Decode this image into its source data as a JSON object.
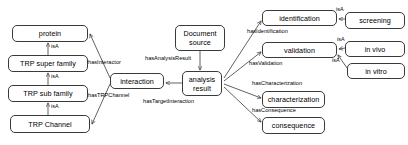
{
  "diagram": {
    "type": "ontology-graph",
    "stroke_color": "#3a3a3a",
    "background_color": "#ffffff",
    "nodes": [
      {
        "id": "protein",
        "label": "protein",
        "x": 12,
        "y": 25,
        "w": 76,
        "h": 17
      },
      {
        "id": "trp_super_family",
        "label": "TRP super family",
        "x": 8,
        "y": 55,
        "w": 80,
        "h": 17
      },
      {
        "id": "trp_sub_family",
        "label": "TRP sub family",
        "x": 8,
        "y": 85,
        "w": 80,
        "h": 17
      },
      {
        "id": "trp_channel",
        "label": "TRP Channel",
        "x": 10,
        "y": 115,
        "w": 80,
        "h": 18
      },
      {
        "id": "interaction",
        "label": "interaction",
        "x": 110,
        "y": 73,
        "w": 54,
        "h": 16
      },
      {
        "id": "document_source",
        "label": "Document\nsource",
        "x": 175,
        "y": 25,
        "w": 50,
        "h": 26
      },
      {
        "id": "analysis_result",
        "label": "analysis\nresult",
        "x": 182,
        "y": 71,
        "w": 40,
        "h": 25
      },
      {
        "id": "identification",
        "label": "identification",
        "x": 262,
        "y": 10,
        "w": 75,
        "h": 16
      },
      {
        "id": "screening",
        "label": "screening",
        "x": 345,
        "y": 12,
        "w": 60,
        "h": 17
      },
      {
        "id": "validation",
        "label": "validation",
        "x": 262,
        "y": 42,
        "w": 75,
        "h": 16
      },
      {
        "id": "in_vivo",
        "label": "in vivo",
        "x": 345,
        "y": 41,
        "w": 60,
        "h": 16
      },
      {
        "id": "in_vitro",
        "label": "in vitro",
        "x": 347,
        "y": 63,
        "w": 58,
        "h": 16
      },
      {
        "id": "characterization",
        "label": "characterization",
        "x": 262,
        "y": 91,
        "w": 63,
        "h": 17
      },
      {
        "id": "consequence",
        "label": "consequence",
        "x": 262,
        "y": 117,
        "w": 63,
        "h": 17
      }
    ],
    "edge_labels": [
      {
        "id": "isa-protein",
        "text": "isA",
        "x": 46,
        "y": 44
      },
      {
        "id": "isa-super",
        "text": "isA",
        "x": 46,
        "y": 74
      },
      {
        "id": "isa-sub",
        "text": "isA",
        "x": 46,
        "y": 104
      },
      {
        "id": "has-interactor",
        "text": "hasInteractor",
        "x": 88,
        "y": 60
      },
      {
        "id": "has-trp-channel",
        "text": "hasTRPChannel",
        "x": 88,
        "y": 93
      },
      {
        "id": "has-analysis-result",
        "text": "hasAnalysisResult",
        "x": 145,
        "y": 56
      },
      {
        "id": "has-target-interaction",
        "text": "hasTargetInteraction",
        "x": 143,
        "y": 99
      },
      {
        "id": "has-identification",
        "text": "hasIdentification",
        "x": 247,
        "y": 29
      },
      {
        "id": "has-validation",
        "text": "hasValidation",
        "x": 249,
        "y": 60
      },
      {
        "id": "has-characterization",
        "text": "hasCharacterization",
        "x": 252,
        "y": 80
      },
      {
        "id": "has-consequence",
        "text": "hasConsequence",
        "x": 252,
        "y": 107
      },
      {
        "id": "isa-screening",
        "text": "isA",
        "x": 337,
        "y": 7
      },
      {
        "id": "isa-invivo",
        "text": "isA",
        "x": 338,
        "y": 37
      },
      {
        "id": "isa-invitro",
        "text": "isA",
        "x": 333,
        "y": 58
      }
    ]
  }
}
